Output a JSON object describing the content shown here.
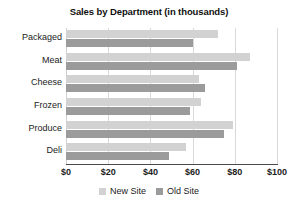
{
  "chart_data": {
    "type": "bar",
    "orientation": "horizontal",
    "title": "Sales by Department (in thousands)",
    "xlabel": "",
    "ylabel": "",
    "xlim": [
      0,
      100
    ],
    "grid": true,
    "legend_position": "bottom",
    "categories": [
      "Packaged",
      "Meat",
      "Cheese",
      "Frozen",
      "Produce",
      "Deli"
    ],
    "tick_labels": [
      "$0",
      "$20",
      "$40",
      "$60",
      "$80",
      "$100"
    ],
    "tick_values": [
      0,
      20,
      40,
      60,
      80,
      100
    ],
    "series": [
      {
        "name": "New Site",
        "color": "#d2d2d2",
        "values": [
          72,
          87,
          63,
          64,
          79,
          57
        ]
      },
      {
        "name": "Old Site",
        "color": "#9b9b9b",
        "values": [
          60,
          81,
          66,
          59,
          75,
          49
        ]
      }
    ]
  },
  "colors": {
    "new_site": "#d2d2d2",
    "old_site": "#9b9b9b",
    "gridline": "#d9d9d9",
    "axis": "#4a4a4a",
    "text": "#1b1b1b",
    "background": "#ffffff"
  }
}
